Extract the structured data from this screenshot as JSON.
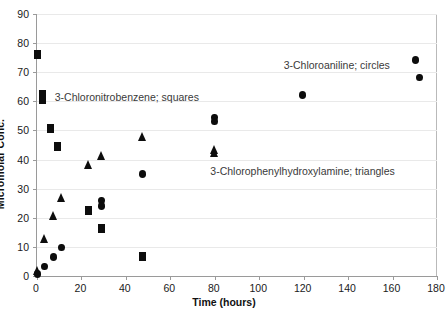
{
  "chart_data": {
    "type": "scatter",
    "title": "",
    "xlabel": "Time (hours)",
    "ylabel": "Micromolar Conc.",
    "xlim": [
      0,
      180
    ],
    "ylim": [
      0,
      90
    ],
    "xticks": [
      0,
      20,
      40,
      60,
      80,
      100,
      120,
      140,
      160,
      180
    ],
    "yticks": [
      0,
      10,
      20,
      30,
      40,
      50,
      60,
      70,
      80,
      90
    ],
    "grid": "horizontal",
    "legend_position": "inline-annotations",
    "marker_color": "#0d0d0d",
    "series": [
      {
        "name": "3-Chloronitrobenzene",
        "marker": "square",
        "label": "3-Chloronitrobenzene; squares",
        "points": [
          {
            "x": 0.4,
            "y": 76.0
          },
          {
            "x": 2.3,
            "y": 62.2
          },
          {
            "x": 2.3,
            "y": 60.6
          },
          {
            "x": 6.2,
            "y": 50.6
          },
          {
            "x": 9.3,
            "y": 44.4
          },
          {
            "x": 23.0,
            "y": 22.6
          },
          {
            "x": 29.0,
            "y": 16.2
          },
          {
            "x": 47.3,
            "y": 6.8
          }
        ]
      },
      {
        "name": "3-Chloroaniline",
        "marker": "circle",
        "label": "3-Chloroaniline; circles",
        "points": [
          {
            "x": 0.4,
            "y": 0.7
          },
          {
            "x": 3.3,
            "y": 3.2
          },
          {
            "x": 7.3,
            "y": 6.6
          },
          {
            "x": 11.0,
            "y": 9.8
          },
          {
            "x": 29.0,
            "y": 25.9
          },
          {
            "x": 29.0,
            "y": 24.0
          },
          {
            "x": 47.3,
            "y": 35.0
          },
          {
            "x": 80.0,
            "y": 54.5
          },
          {
            "x": 80.0,
            "y": 53.0
          },
          {
            "x": 119.5,
            "y": 62.2
          },
          {
            "x": 170.5,
            "y": 74.2
          },
          {
            "x": 172.0,
            "y": 68.2
          }
        ]
      },
      {
        "name": "3-Chlorophenylhydroxylamine",
        "marker": "triangle",
        "label": "3-Chlorophenylhydroxylamine; triangles",
        "points": [
          {
            "x": 0.4,
            "y": 2.0
          },
          {
            "x": 3.3,
            "y": 13.0
          },
          {
            "x": 7.3,
            "y": 20.8
          },
          {
            "x": 11.0,
            "y": 27.0
          },
          {
            "x": 23.0,
            "y": 38.2
          },
          {
            "x": 29.0,
            "y": 41.5
          },
          {
            "x": 47.3,
            "y": 47.8
          },
          {
            "x": 80.0,
            "y": 43.6
          },
          {
            "x": 80.0,
            "y": 42.4
          }
        ]
      }
    ],
    "annotations": [
      {
        "text": "3-Chloroaniline; circles",
        "x": 111.0,
        "y": 72.5,
        "align": "right-of-anchor"
      },
      {
        "text": "3-Chloronitrobenzene; squares",
        "x": 8.0,
        "y": 61.5,
        "align": "left"
      },
      {
        "text": "3-Chlorophenylhydroxylamine; triangles",
        "x": 78.0,
        "y": 36.0,
        "align": "left"
      }
    ]
  }
}
